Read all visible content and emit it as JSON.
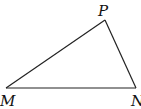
{
  "diagram": {
    "type": "triangle",
    "stroke_color": "#222222",
    "vertices": [
      {
        "name": "M",
        "x": 6,
        "y": 88
      },
      {
        "name": "N",
        "x": 136,
        "y": 88
      },
      {
        "name": "P",
        "x": 105,
        "y": 20
      }
    ],
    "labels": {
      "M": "M",
      "N": "N",
      "P": "P"
    },
    "sides": [
      "MN",
      "NP",
      "PM"
    ]
  }
}
